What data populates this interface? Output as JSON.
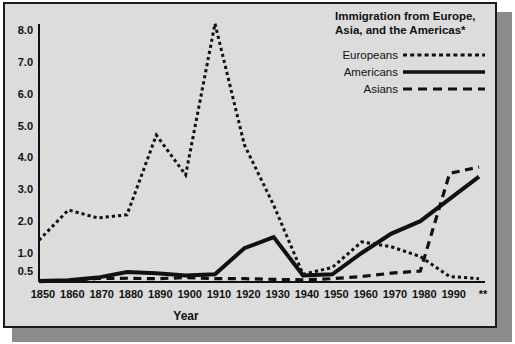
{
  "chart_data": {
    "type": "line",
    "title": "Immigration from Europe, Asia, and the Americas*",
    "title_line1": "Immigration from Europe,",
    "title_line2": "Asia, and the Americas*",
    "xlabel": "Year",
    "ylabel": "",
    "x": [
      "1850",
      "1860",
      "1870",
      "1880",
      "1890",
      "1900",
      "1910",
      "1920",
      "1930",
      "1940",
      "1950",
      "1960",
      "1970",
      "1980",
      "1990",
      "**"
    ],
    "xtick_labels": [
      "1850",
      "1860",
      "1870",
      "1880",
      "1890",
      "1900",
      "1910",
      "1920",
      "1930",
      "1940",
      "1950",
      "1960",
      "1970",
      "1980",
      "1990",
      "**"
    ],
    "ytick_labels": [
      "0.5",
      "1.0",
      "2.0",
      "3.0",
      "4.0",
      "5.0",
      "6.0",
      "7.0",
      "8.0"
    ],
    "ytick_values": [
      0.5,
      1.0,
      2.0,
      3.0,
      4.0,
      5.0,
      6.0,
      7.0,
      8.0
    ],
    "ylim": [
      0,
      8.6
    ],
    "grid": false,
    "legend_position": "top-right",
    "series": [
      {
        "name": "Europeans",
        "style": "dotted",
        "values": [
          1.4,
          2.35,
          2.1,
          2.2,
          4.7,
          3.45,
          8.2,
          4.4,
          2.5,
          0.35,
          0.6,
          1.35,
          1.2,
          0.9,
          0.25,
          0.15
        ]
      },
      {
        "name": "Americans",
        "style": "solid",
        "values": [
          0.05,
          0.08,
          0.2,
          0.45,
          0.4,
          0.3,
          0.35,
          1.15,
          1.5,
          0.3,
          0.35,
          1.0,
          1.6,
          2.0,
          2.7,
          3.4
        ]
      },
      {
        "name": "Asians",
        "style": "dashed",
        "values": [
          0.02,
          0.05,
          0.16,
          0.17,
          0.15,
          0.2,
          0.15,
          0.15,
          0.12,
          0.1,
          0.15,
          0.25,
          0.4,
          0.5,
          3.5,
          3.7
        ]
      }
    ]
  },
  "legend": {
    "title_line1": "Immigration from Europe,",
    "title_line2": "Asia, and the Americas*",
    "entries": [
      {
        "label": "Europeans",
        "style": "dotted"
      },
      {
        "label": "Americans",
        "style": "solid"
      },
      {
        "label": "Asians",
        "style": "dashed"
      }
    ]
  },
  "axes": {
    "x_title": "Year",
    "y_title": ""
  },
  "colors": {
    "ink": "#111111",
    "plot_background": "#dcdcdc",
    "frame_border": "#1a1a1a",
    "page_background": "#ffffff",
    "shadow": "#8b8b8b"
  }
}
